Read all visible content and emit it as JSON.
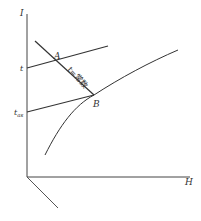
{
  "diagram": {
    "axes": {
      "y_label": "I",
      "x_label": "H"
    },
    "tick_labels": {
      "t": "t",
      "t_as_main": "t",
      "t_as_sub": "as"
    },
    "points": {
      "A": "A",
      "B": "B"
    },
    "isotherm_label": "t=常数",
    "colors": {
      "line": "#333333",
      "background": "#ffffff"
    }
  }
}
